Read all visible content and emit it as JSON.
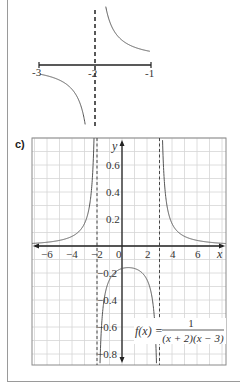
{
  "chart_data": [
    {
      "id": "b",
      "type": "line",
      "title": "",
      "description": "Zoomed sketch of the curve near the vertical asymptote x = -2",
      "xlabel": "",
      "ylabel": "",
      "x_ticks": [
        "-3",
        "-2",
        "-1"
      ],
      "xlim": [
        -3,
        -1
      ],
      "asymptotes": {
        "vertical": [
          -2
        ]
      },
      "grid": false,
      "series": [
        {
          "name": "left branch",
          "x_range": [
            -3,
            -2.1
          ],
          "behaviour": "rises to +infinity as x -> -2 from the left"
        },
        {
          "name": "right branch",
          "x_range": [
            -1.9,
            -1
          ],
          "behaviour": "falls to -infinity as x -> -2 from the right"
        }
      ]
    },
    {
      "id": "c",
      "type": "line",
      "label": "c)",
      "function": "f(x) = 1 / ((x + 2)(x - 3))",
      "function_label": {
        "lhs": "f(x) =",
        "numerator": "1",
        "denominator": "(x + 2)(x − 3)"
      },
      "xlabel": "x",
      "ylabel": "y",
      "x_ticks": [
        "−6",
        "−4",
        "−2",
        "0",
        "2",
        "4",
        "6"
      ],
      "x_tick_values": [
        -6,
        -4,
        -2,
        0,
        2,
        4,
        6
      ],
      "y_ticks": [
        "0.6",
        "0.4",
        "0.2",
        "−0.2",
        "−0.4",
        "−0.6",
        "−0.8"
      ],
      "y_tick_values": [
        0.6,
        0.4,
        0.2,
        -0.2,
        -0.4,
        -0.6,
        -0.8
      ],
      "xlim": [
        -7.2,
        8.3
      ],
      "ylim": [
        -0.88,
        0.8
      ],
      "grid": true,
      "asymptotes": {
        "vertical": [
          -2,
          3
        ],
        "horizontal": [
          0
        ]
      },
      "key_points": [
        {
          "x": 0.5,
          "y": -0.16,
          "note": "local maximum of middle branch"
        }
      ],
      "series": [
        {
          "name": "left branch",
          "x_range": [
            -7.2,
            -2.1
          ]
        },
        {
          "name": "middle branch",
          "x_range": [
            -1.9,
            2.9
          ]
        },
        {
          "name": "right branch",
          "x_range": [
            3.1,
            8.3
          ]
        }
      ]
    }
  ]
}
